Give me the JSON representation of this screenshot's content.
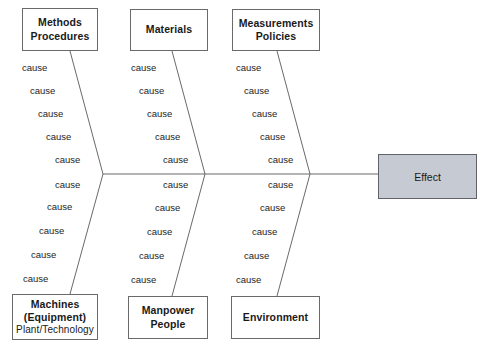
{
  "diagram": {
    "type": "fishbone-ishikawa",
    "effect": {
      "label": "Effect",
      "fill_color": "#c6cad2",
      "border_color": "#5f6268"
    },
    "categories": [
      {
        "id": "methods-procedures",
        "position": "top-left",
        "lines": [
          "Methods",
          "Procedures"
        ],
        "cause_count": 5,
        "causes": [
          "cause",
          "cause",
          "cause",
          "cause",
          "cause"
        ]
      },
      {
        "id": "materials",
        "position": "top-middle",
        "lines": [
          "Materials"
        ],
        "cause_count": 5,
        "causes": [
          "cause",
          "cause",
          "cause",
          "cause",
          "cause"
        ]
      },
      {
        "id": "measurements-policies",
        "position": "top-right",
        "lines": [
          "Measurements",
          "Policies"
        ],
        "cause_count": 5,
        "causes": [
          "cause",
          "cause",
          "cause",
          "cause",
          "cause"
        ]
      },
      {
        "id": "machines-equipment",
        "position": "bottom-left",
        "lines": [
          "Machines",
          "(Equipment)",
          "Plant/Technology"
        ],
        "cause_count": 5,
        "causes": [
          "cause",
          "cause",
          "cause",
          "cause",
          "cause"
        ]
      },
      {
        "id": "manpower-people",
        "position": "bottom-middle",
        "lines": [
          "Manpower",
          "People"
        ],
        "cause_count": 5,
        "causes": [
          "cause",
          "cause",
          "cause",
          "cause",
          "cause"
        ]
      },
      {
        "id": "environment",
        "position": "bottom-right",
        "lines": [
          "Environment"
        ],
        "cause_count": 5,
        "causes": [
          "cause",
          "cause",
          "cause",
          "cause",
          "cause"
        ]
      }
    ],
    "line_color": "#6a6a6a",
    "background_color": "#ffffff"
  }
}
